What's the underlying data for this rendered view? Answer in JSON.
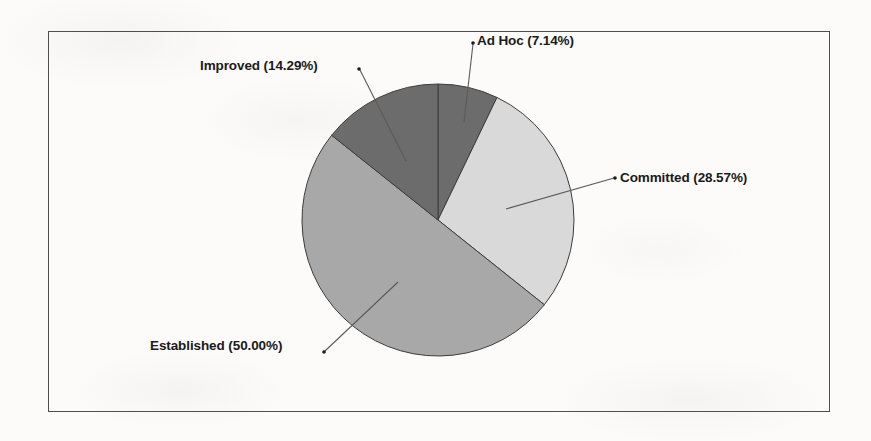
{
  "chart_data": {
    "type": "pie",
    "title": "",
    "subtitle": "",
    "xlabel": "",
    "ylabel": "",
    "legend_position": "none",
    "grid": false,
    "start_angle_deg": 0,
    "direction": "clockwise",
    "center": {
      "x": 438,
      "y": 220
    },
    "radius": 136,
    "categories": [
      "Ad Hoc",
      "Committed",
      "Established",
      "Improved"
    ],
    "values": [
      7.14,
      28.57,
      50.0,
      14.29
    ],
    "value_unit": "percent",
    "labels": [
      "Ad Hoc (7.14%)",
      "Committed (28.57%)",
      "Established (50.00%)",
      "Improved (14.29%)"
    ],
    "colors": [
      "#6c6c6c",
      "#d9d9d9",
      "#a8a8a8",
      "#6c6c6c"
    ],
    "slices": [
      {
        "name": "Ad Hoc",
        "label": "Ad Hoc (7.14%)",
        "value": 7.14,
        "color": "#6c6c6c"
      },
      {
        "name": "Committed",
        "label": "Committed (28.57%)",
        "value": 28.57,
        "color": "#d9d9d9"
      },
      {
        "name": "Established",
        "label": "Established (50.00%)",
        "value": 50.0,
        "color": "#a8a8a8"
      },
      {
        "name": "Improved",
        "label": "Improved (14.29%)",
        "value": 14.29,
        "color": "#6c6c6c"
      }
    ]
  },
  "frame": {
    "border_color": "#4e4e4e",
    "background": "#fcfbfa"
  }
}
